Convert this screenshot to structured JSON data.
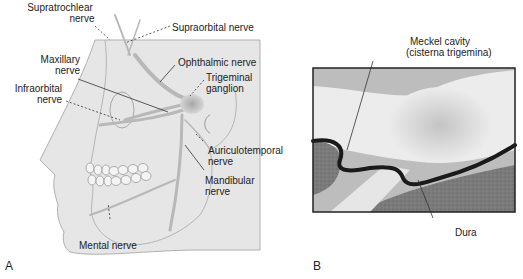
{
  "figure": {
    "panel_a": {
      "letter": "A",
      "labels": {
        "supratrochlear_1": "Supratrochlear",
        "supratrochlear_2": "nerve",
        "supraorbital": "Supraorbital nerve",
        "maxillary_1": "Maxillary",
        "maxillary_2": "nerve",
        "ophthalmic": "Ophthalmic nerve",
        "trigeminal_1": "Trigeminal",
        "trigeminal_2": "ganglion",
        "infraorbital_1": "Infraorbital",
        "infraorbital_2": "nerve",
        "auriculotemporal_1": "Auriculotemporal",
        "auriculotemporal_2": "nerve",
        "mandibular_1": "Mandibular",
        "mandibular_2": "nerve",
        "mental": "Mental nerve"
      }
    },
    "panel_b": {
      "letter": "B",
      "labels": {
        "meckel_1": "Meckel cavity",
        "meckel_2": "(cisterna trigemina)",
        "dura": "Dura"
      }
    }
  }
}
